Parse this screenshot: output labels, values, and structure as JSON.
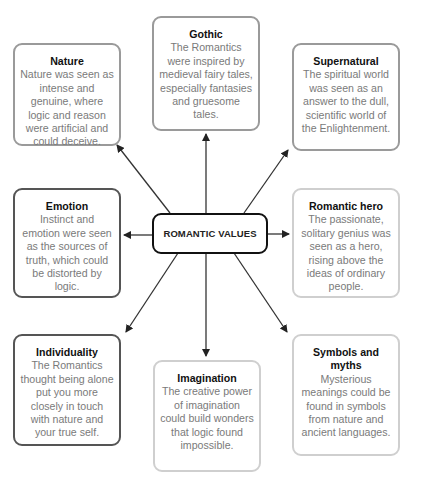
{
  "diagram": {
    "center": {
      "label": "ROMANTIC VALUES"
    },
    "nodes": [
      {
        "id": "nature",
        "title": "Nature",
        "text": "Nature was seen as intense and genuine, where logic and reason were artificial and could deceive."
      },
      {
        "id": "gothic",
        "title": "Gothic",
        "text": "The Romantics were inspired by medieval fairy tales, especially fantasies and gruesome tales."
      },
      {
        "id": "supernatural",
        "title": "Supernatural",
        "text": "The spiritual world was seen as an answer to the dull, scientific world of the Enlightenment."
      },
      {
        "id": "emotion",
        "title": "Emotion",
        "text": "Instinct and emotion were seen as the sources of truth, which could be distorted by logic."
      },
      {
        "id": "romantic-hero",
        "title": "Romantic hero",
        "text": "The passionate, solitary genius was seen as a hero, rising above the ideas of ordinary people."
      },
      {
        "id": "individuality",
        "title": "Individuality",
        "text": "The Romantics thought being alone put you more closely in touch with nature and your true self."
      },
      {
        "id": "imagination",
        "title": "Imagination",
        "text": "The creative power of imagination could build wonders that logic found impossible."
      },
      {
        "id": "symbols-and-myths",
        "title": "Symbols and myths",
        "text": "Mysterious meanings could be found in symbols from nature and ancient languages."
      }
    ],
    "colors": {
      "dark_border": "#555555",
      "mid_border": "#9a9a9a",
      "light_border": "#cfcfcf",
      "body_text": "#7a7a7a",
      "title_text": "#111111",
      "arrow": "#222222"
    }
  }
}
